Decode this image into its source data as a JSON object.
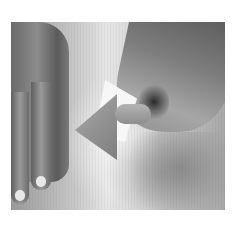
{
  "image": {
    "description": "Grayscale photograph of two hands on a light cloth; the right hand holds a folded piece of paper revealing a gray triangle",
    "colors": {
      "background": "#ffffff",
      "cloth_light": "#e6e6e6",
      "cloth_mid": "#c8c8c8",
      "skin_dark": "#5a5a5a",
      "triangle": "#8f8f8f",
      "paper": "#f7f7f7"
    }
  }
}
